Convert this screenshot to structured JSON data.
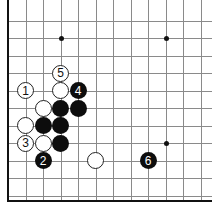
{
  "diagram": {
    "type": "go-board-fragment",
    "grid": {
      "cols": 12,
      "rows": 11,
      "visible_edges": [
        "left",
        "bottom"
      ]
    },
    "star_points": [
      {
        "col": 3,
        "row": 2
      },
      {
        "col": 9,
        "row": 2
      },
      {
        "col": 9,
        "row": 8
      }
    ],
    "stones": [
      {
        "color": "white",
        "col": 1,
        "row": 5,
        "label": "1"
      },
      {
        "color": "white",
        "col": 3,
        "row": 4,
        "label": "5"
      },
      {
        "color": "white",
        "col": 3,
        "row": 5,
        "label": ""
      },
      {
        "color": "black",
        "col": 4,
        "row": 5,
        "label": "4"
      },
      {
        "color": "white",
        "col": 2,
        "row": 6,
        "label": ""
      },
      {
        "color": "black",
        "col": 3,
        "row": 6,
        "label": ""
      },
      {
        "color": "black",
        "col": 4,
        "row": 6,
        "label": ""
      },
      {
        "color": "white",
        "col": 1,
        "row": 7,
        "label": ""
      },
      {
        "color": "black",
        "col": 2,
        "row": 7,
        "label": ""
      },
      {
        "color": "black",
        "col": 3,
        "row": 7,
        "label": ""
      },
      {
        "color": "white",
        "col": 1,
        "row": 8,
        "label": "3"
      },
      {
        "color": "white",
        "col": 2,
        "row": 8,
        "label": ""
      },
      {
        "color": "black",
        "col": 3,
        "row": 8,
        "label": ""
      },
      {
        "color": "black",
        "col": 2,
        "row": 9,
        "label": "2"
      },
      {
        "color": "white",
        "col": 5,
        "row": 9,
        "label": ""
      },
      {
        "color": "black",
        "col": 8,
        "row": 9,
        "label": "6"
      }
    ]
  },
  "colors": {
    "black_stone": "#0d0d0d",
    "white_stone": "#ffffff",
    "grid_line": "#8a8a8a",
    "board_edge": "#111111"
  }
}
